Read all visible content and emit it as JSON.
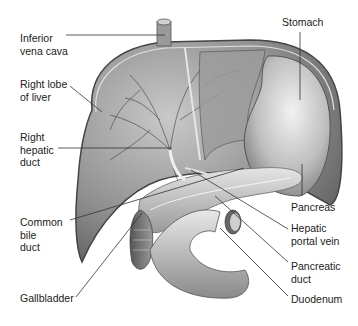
{
  "figure": {
    "labels": {
      "inferior_vena_cava": "Inferior\nvena cava",
      "right_lobe": "Right lobe\nof liver",
      "right_hepatic_duct": "Right\nhepatic\nduct",
      "common_bile_duct": "Common\nbile\nduct",
      "gallbladder": "Gallbladder",
      "stomach": "Stomach",
      "pancreas": "Pancreas",
      "hepatic_portal_vein": "Hepatic\nportal vein",
      "pancreatic_duct": "Pancreatic\nduct",
      "duodenum": "Duodenum"
    },
    "colors": {
      "background": "#ffffff",
      "text": "#222222",
      "leader_line": "#333333",
      "organ_dark": "#6e6e6e",
      "organ_mid": "#a0a0a0",
      "organ_light": "#d8d8d8"
    }
  }
}
